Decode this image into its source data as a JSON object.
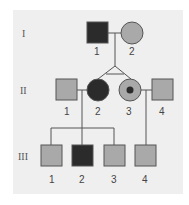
{
  "colors": {
    "affected": "#2b2b2b",
    "unaffected": "#a9a9a9",
    "line": "#555555",
    "background": "#efefef",
    "carrier_dot": "#2b2b2b"
  },
  "generations": [
    {
      "label": "I",
      "members": [
        {
          "id": "1",
          "sex": "male",
          "status": "affected"
        },
        {
          "id": "2",
          "sex": "female",
          "status": "unaffected"
        }
      ]
    },
    {
      "label": "II",
      "members": [
        {
          "id": "1",
          "sex": "male",
          "status": "unaffected"
        },
        {
          "id": "2",
          "sex": "female",
          "status": "affected",
          "twin": "identical-with-II-3"
        },
        {
          "id": "3",
          "sex": "female",
          "status": "carrier",
          "twin": "identical-with-II-2"
        },
        {
          "id": "4",
          "sex": "male",
          "status": "unaffected"
        }
      ]
    },
    {
      "label": "III",
      "members": [
        {
          "id": "1",
          "sex": "male",
          "status": "unaffected"
        },
        {
          "id": "2",
          "sex": "male",
          "status": "affected"
        },
        {
          "id": "3",
          "sex": "male",
          "status": "unaffected"
        },
        {
          "id": "4",
          "sex": "male",
          "status": "unaffected"
        }
      ]
    }
  ]
}
